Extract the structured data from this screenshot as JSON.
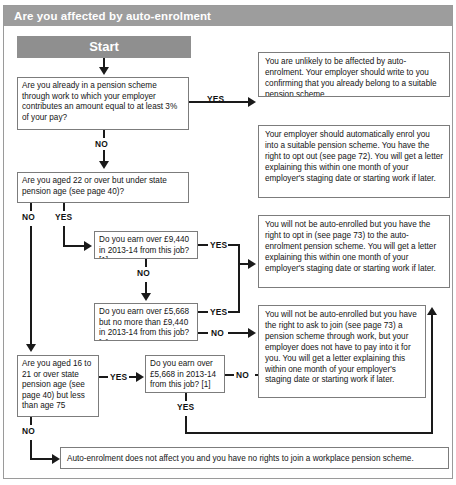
{
  "figure": {
    "title": "Are you affected by auto-enrolment",
    "start_label": "Start"
  },
  "questions": [
    {
      "id": "q-pension-scheme",
      "text": "Are you already in a pension scheme through work to which your employer contributes an amount equal to at least 3% of your pay?"
    },
    {
      "id": "q-age-22-spa",
      "text": "Are you aged 22 or over but under state pension age (see page 40)?"
    },
    {
      "id": "q-earn-over-9440",
      "text": "Do you earn over £9,440 in 2013-14 from this job? [1]"
    },
    {
      "id": "q-earn-5668-to-9440",
      "text": "Do you earn over £5,668 but no more than £9,440 in 2013-14 from this job? [1]"
    },
    {
      "id": "q-age-16-21-or-spa-75",
      "text": "Are you aged 16 to 21 or over state pension age (see page 40) but less than age 75"
    },
    {
      "id": "q-earn-over-5668",
      "text": "Do you earn over £5,668 in 2013-14 from this job? [1]"
    }
  ],
  "outcomes": [
    {
      "id": "outcome-unlikely-affected",
      "text": "You are unlikely to be affected by auto-enrolment. Your employer should write to you confirming that you already belong to a suitable pension scheme."
    },
    {
      "id": "outcome-auto-enrolled",
      "text": "Your employer should automatically enrol you into a suitable pension scheme. You have the right to opt out (see page 72). You will get a letter explaining this within one month of your employer's staging date or starting work if later."
    },
    {
      "id": "outcome-opt-in",
      "text": "You will not be auto-enrolled but you have the right to opt in (see page 73) to the auto-enrolment pension scheme. You will get a letter explaining this within one month of your employer's staging date or starting work if later."
    },
    {
      "id": "outcome-ask-to-join",
      "text": "You will not be auto-enrolled but you have the right to ask to join (see page 73) a pension scheme through work, but your employer does not have to pay into it for you. You will get a letter explaining this within one month of your employer's staging date or starting work if later."
    },
    {
      "id": "outcome-not-affected",
      "text": "Auto-enrolment does not affect you and you have no rights to join a workplace pension scheme."
    }
  ],
  "edges": {
    "yes": "YES",
    "no": "NO"
  },
  "colors": {
    "header_band": "#9d9d9d",
    "start_band": "#8f8f8f",
    "box_border": "#7c7c7c",
    "connector": "#1a1a1a",
    "text": "#141414"
  }
}
